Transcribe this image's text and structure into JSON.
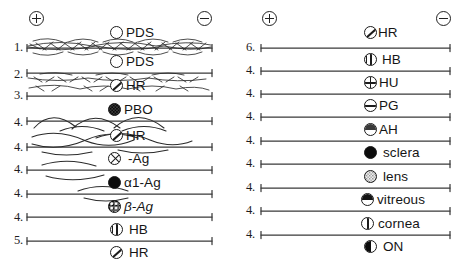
{
  "figure": {
    "type": "two-panel gel trace diagram",
    "background_color": "#ffffff",
    "ink_color": "#1a1a1a"
  },
  "polarity": {
    "anode": {
      "symbol": "⊕",
      "name": "circled-plus",
      "label": "+"
    },
    "cathode": {
      "symbol": "⊖",
      "name": "circled-minus",
      "label": "−"
    }
  },
  "panels": [
    {
      "id": "left",
      "anode_label": "+",
      "cathode_label": "−",
      "rows": [
        {
          "number": "1.",
          "marker": "open",
          "label": "PDS",
          "italic": false,
          "trace": "dense-feather"
        },
        {
          "number": "2.",
          "marker": "open",
          "label": "PDS",
          "italic": false,
          "trace": "sparse-feather"
        },
        {
          "number": "3.",
          "marker": "slash",
          "label": "HR",
          "italic": false,
          "trace": "light-feather"
        },
        {
          "number": "4.",
          "marker": "stipple-dark",
          "label": "PBO",
          "italic": false,
          "trace": "broad-arcs"
        },
        {
          "number": "4.",
          "marker": "slash",
          "label": "HR",
          "italic": false,
          "trace": "crossing-arcs"
        },
        {
          "number": "4.",
          "marker": "xhatch",
          "label": "-Ag",
          "italic": false,
          "trace": "single-arc"
        },
        {
          "number": "4.",
          "marker": "solid",
          "label": "α1-Ag",
          "italic": false,
          "trace": "small-arc"
        },
        {
          "number": "4.",
          "marker": "stipple-mottle",
          "label": "β-Ag",
          "italic": true,
          "trace": "flat"
        },
        {
          "number": "5.",
          "marker": "vbar",
          "label": "HB",
          "italic": false,
          "trace": "flat"
        },
        {
          "number": "",
          "marker": "slash",
          "label": "HR",
          "italic": false,
          "trace": "none"
        }
      ]
    },
    {
      "id": "right",
      "anode_label": "+",
      "cathode_label": "−",
      "rows": [
        {
          "number": "6.",
          "marker": "slash",
          "label": "HR",
          "italic": false,
          "trace": "flat"
        },
        {
          "number": "4.",
          "marker": "vbar",
          "label": "HB",
          "italic": false,
          "trace": "flat"
        },
        {
          "number": "4.",
          "marker": "grid",
          "label": "HU",
          "italic": false,
          "trace": "flat"
        },
        {
          "number": "4.",
          "marker": "hbar",
          "label": "PG",
          "italic": false,
          "trace": "flat"
        },
        {
          "number": "4.",
          "marker": "halftop",
          "label": "AH",
          "italic": false,
          "trace": "flat"
        },
        {
          "number": "4.",
          "marker": "solid",
          "label": "sclera",
          "italic": false,
          "trace": "flat"
        },
        {
          "number": "4.",
          "marker": "stipple-light",
          "label": "lens",
          "italic": false,
          "trace": "flat"
        },
        {
          "number": "4.",
          "marker": "halftop-dark",
          "label": "vitreous",
          "italic": false,
          "trace": "flat"
        },
        {
          "number": "4.",
          "marker": "split",
          "label": "cornea",
          "italic": false,
          "trace": "flat"
        },
        {
          "number": "",
          "marker": "halfleft",
          "label": "ON",
          "italic": false,
          "trace": "none"
        }
      ]
    }
  ]
}
